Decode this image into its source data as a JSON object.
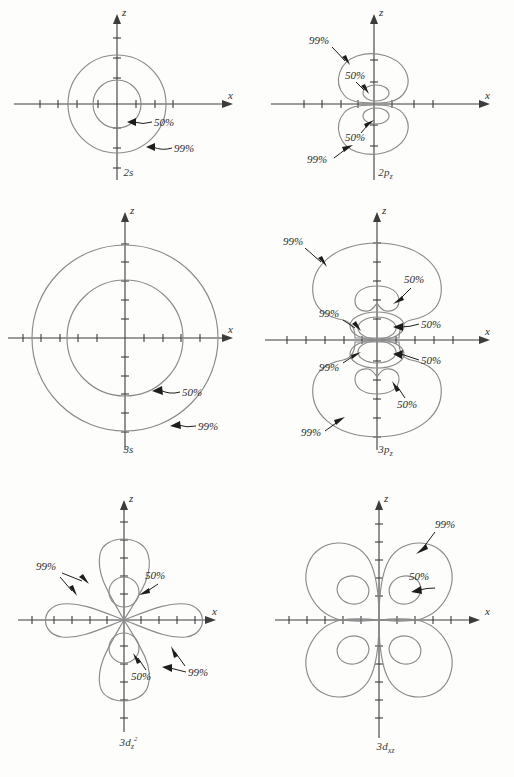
{
  "figure": {
    "contour_labels": {
      "inner": "50%",
      "outer": "99%"
    },
    "axis_labels": {
      "horizontal": "x",
      "vertical": "z"
    },
    "line_colors": {
      "contour": "#8a8a8a",
      "axis": "#3c3c3c",
      "leader": "#1d1d1d",
      "background": "#fdfdfc"
    }
  },
  "panels": [
    {
      "id": "2s",
      "caption_main": "2",
      "caption_sub": "s",
      "orbital_type": "s",
      "shape": "concentric-circles",
      "annotations": [
        {
          "label": "50%",
          "target": "inner contour"
        },
        {
          "label": "99%",
          "target": "outer contour"
        }
      ]
    },
    {
      "id": "2pz",
      "caption_main": "2",
      "caption_sub": "p",
      "caption_sub2": "z",
      "orbital_type": "p",
      "shape": "two-vertical-lobes",
      "annotations": [
        {
          "label": "99%",
          "target": "upper outer lobe"
        },
        {
          "label": "50%",
          "target": "upper inner contour"
        },
        {
          "label": "50%",
          "target": "lower inner contour"
        },
        {
          "label": "99%",
          "target": "lower outer lobe"
        }
      ]
    },
    {
      "id": "3s",
      "caption_main": "3",
      "caption_sub": "s",
      "orbital_type": "s",
      "shape": "concentric-circles",
      "annotations": [
        {
          "label": "50%",
          "target": "inner contour"
        },
        {
          "label": "99%",
          "target": "outer contour"
        }
      ]
    },
    {
      "id": "3pz",
      "caption_main": "3",
      "caption_sub": "p",
      "caption_sub2": "z",
      "orbital_type": "p",
      "shape": "two-vertical-lobes-with-inner-nodal-structure",
      "annotations": [
        {
          "label": "99%",
          "target": "upper outer lobe"
        },
        {
          "label": "50%",
          "target": "upper crescent contour"
        },
        {
          "label": "99%",
          "target": "upper inner oval"
        },
        {
          "label": "50%",
          "target": "upper inner oval"
        },
        {
          "label": "99%",
          "target": "lower inner oval"
        },
        {
          "label": "50%",
          "target": "lower inner oval"
        },
        {
          "label": "50%",
          "target": "lower crescent contour"
        },
        {
          "label": "99%",
          "target": "lower outer lobe"
        }
      ]
    },
    {
      "id": "3dz2",
      "caption_main": "3",
      "caption_sub": "d",
      "caption_sub2": "z",
      "caption_sup": "2",
      "orbital_type": "d",
      "shape": "two-vertical-lobes-plus-torus-lobes",
      "annotations": [
        {
          "label": "99%",
          "target": "upper and side lobes"
        },
        {
          "label": "50%",
          "target": "upper small circle"
        },
        {
          "label": "50%",
          "target": "lower small circle"
        },
        {
          "label": "99%",
          "target": "lower right lobe"
        }
      ]
    },
    {
      "id": "3dxz",
      "caption_main": "3",
      "caption_sub": "d",
      "caption_sub2": "xz",
      "orbital_type": "d",
      "shape": "four-quadrant-lobes",
      "annotations": [
        {
          "label": "99%",
          "target": "upper right lobe"
        },
        {
          "label": "50%",
          "target": "upper right inner oval"
        }
      ]
    }
  ]
}
